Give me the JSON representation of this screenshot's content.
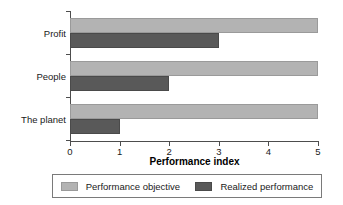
{
  "chart_data": {
    "type": "bar",
    "orientation": "horizontal",
    "title": "",
    "categories": [
      "Profit",
      "People",
      "The planet"
    ],
    "series": [
      {
        "name": "Performance objective",
        "values": [
          5,
          5,
          5
        ],
        "color": "#b3b3b3"
      },
      {
        "name": "Realized performance",
        "values": [
          3,
          2,
          1
        ],
        "color": "#595959"
      }
    ],
    "xlabel": "Performance index",
    "ylabel": "",
    "xlim": [
      0,
      5
    ],
    "xticks": [
      0,
      1,
      2,
      3,
      4,
      5
    ],
    "xtick_labels": [
      "0",
      "1",
      "2",
      "3",
      "4",
      "5"
    ],
    "grid": false,
    "legend_position": "bottom"
  },
  "legend": {
    "entries": [
      {
        "label": "Performance objective",
        "swatch": "objective"
      },
      {
        "label": "Realized performance",
        "swatch": "realized"
      }
    ]
  }
}
